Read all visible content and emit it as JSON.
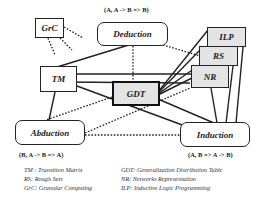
{
  "nodes": {
    "grc": "GrC",
    "deduction": "Deduction",
    "ilp": "ILP",
    "rs": "RS",
    "nr": "NR",
    "tm": "TM",
    "gdt": "GDT",
    "abduction": "Abduction",
    "induction": "Induction"
  },
  "formulas": {
    "deduction": "(A, A -> B => B)",
    "abduction": "(B, A -> B => A)",
    "induction": "(A, B => A -> B)"
  },
  "legend": {
    "left": [
      "TM : Transition Matrix",
      "RS: Rough Sets",
      "GrC: Granular Computing"
    ],
    "right": [
      "GDT:  Generalization Distribution Table",
      "NR:  Networks Representation",
      "ILP: Inductive Logic Programming"
    ]
  },
  "colors": {
    "line": "#222222",
    "shaded_fill": "#e4e4e4"
  }
}
